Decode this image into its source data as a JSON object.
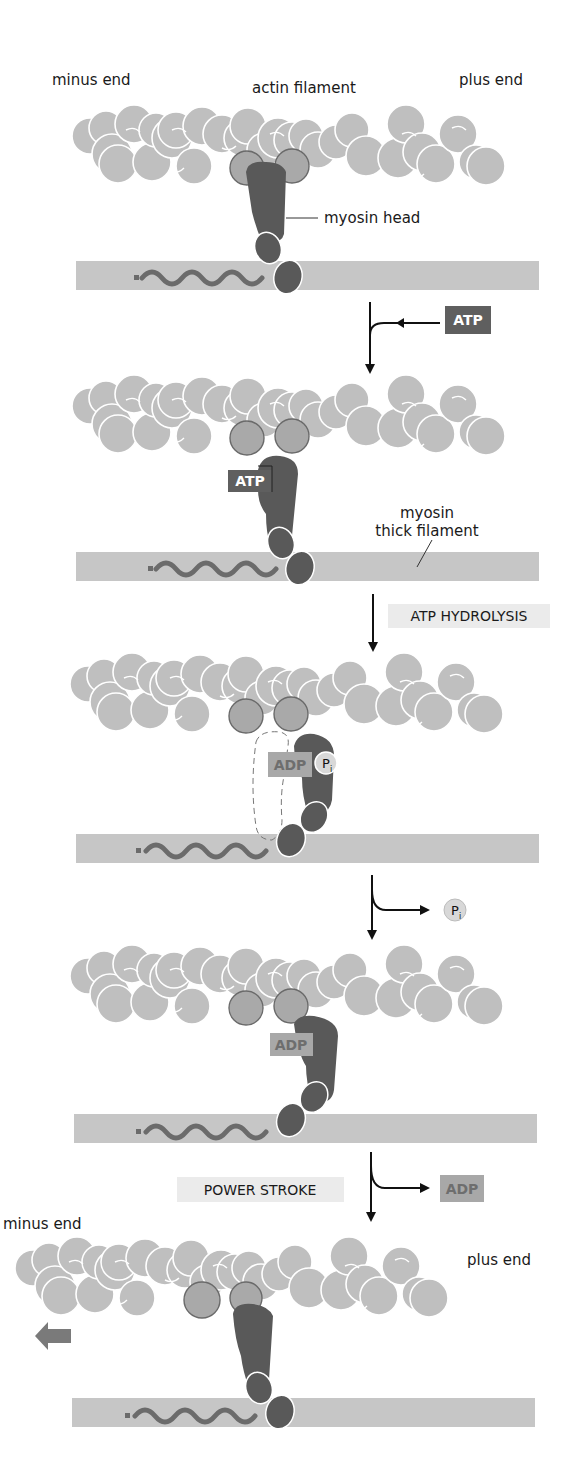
{
  "figure": {
    "colors": {
      "actin": "#bfbfbf",
      "actin_bound": "#a9a9a9",
      "actin_outline": "#ffffff",
      "myosin": "#595959",
      "thick_filament": "#c6c6c6",
      "tail_wave": "#6b6b6b",
      "atp_box": "#5f5f5f",
      "adp_box": "#a8a8a8",
      "adp_text": "#6e6e6e",
      "step_box": "#ebebeb",
      "arrow": "#111111",
      "direction_arrow": "#7a7a7a"
    }
  },
  "panels": [
    {
      "id": 1,
      "labels": {
        "minus_end": "minus end",
        "actin_filament": "actin filament",
        "plus_end": "plus end",
        "myosin_head": "myosin head"
      }
    },
    {
      "id": 2,
      "bound_nucleotide": "ATP",
      "labels": {
        "thick_filament_line1": "myosin",
        "thick_filament_line2": "thick filament"
      }
    },
    {
      "id": 3,
      "bound_nucleotide": "ADP",
      "bound_phosphate": "P",
      "phosphate_subscript": "i"
    },
    {
      "id": 4,
      "bound_nucleotide": "ADP"
    },
    {
      "id": 5,
      "labels": {
        "minus_end": "minus end",
        "plus_end": "plus end"
      },
      "movement_direction": "left"
    }
  ],
  "transitions": [
    {
      "from": 1,
      "to": 2,
      "step_label": "",
      "input": "ATP",
      "output": ""
    },
    {
      "from": 2,
      "to": 3,
      "step_label": "ATP HYDROLYSIS",
      "input": "",
      "output": ""
    },
    {
      "from": 3,
      "to": 4,
      "step_label": "",
      "input": "",
      "output": "P",
      "output_subscript": "i"
    },
    {
      "from": 4,
      "to": 5,
      "step_label": "POWER STROKE",
      "input": "",
      "output": "ADP"
    }
  ]
}
